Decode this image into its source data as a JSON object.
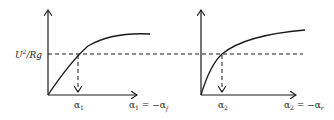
{
  "diagram": {
    "y_label": "U²/Rg",
    "y_label_parts": {
      "base": "U",
      "sup": "2",
      "rest": "/Rg"
    },
    "panels": [
      {
        "id": "front",
        "marker_label": "α₁",
        "marker_base": "α",
        "marker_sub": "1",
        "axis_label": "α₁ = −α_f",
        "axis_label_lhs_base": "α",
        "axis_label_lhs_sub": "1",
        "axis_label_eq": " = −",
        "axis_label_rhs_base": "α",
        "axis_label_rhs_sub": "f"
      },
      {
        "id": "rear",
        "marker_label": "α₂",
        "marker_base": "α",
        "marker_sub": "2",
        "axis_label": "α₂ = −α_r",
        "axis_label_lhs_base": "α",
        "axis_label_lhs_sub": "2",
        "axis_label_eq": " = −",
        "axis_label_rhs_base": "α",
        "axis_label_rhs_sub": "r"
      }
    ],
    "colors": {
      "stroke": "#1a1a1a",
      "background": "#ffffff"
    }
  }
}
